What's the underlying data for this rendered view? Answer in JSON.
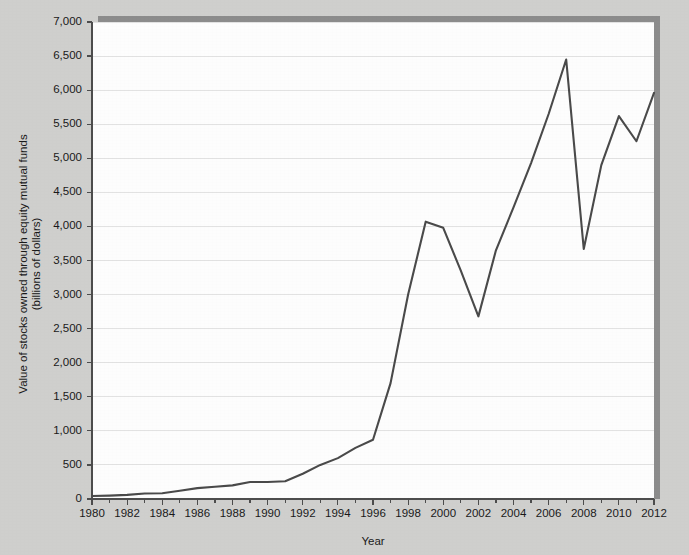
{
  "chart_data": {
    "type": "line",
    "title": "",
    "xlabel": "Year",
    "ylabel": "Value of stocks owned through equity mutual funds (billions of dollars)",
    "ylabel_line1": "Value of stocks owned through equity mutual funds",
    "ylabel_line2": "(billions of dollars)",
    "xlim": [
      1980,
      2012
    ],
    "ylim": [
      0,
      7000
    ],
    "grid": true,
    "legend": "none",
    "x_tick_labels": [
      "1980",
      "1982",
      "1984",
      "1986",
      "1988",
      "1990",
      "1992",
      "1994",
      "1996",
      "1998",
      "2000",
      "2002",
      "2004",
      "2006",
      "2008",
      "2010",
      "2012"
    ],
    "x_tick_values": [
      1980,
      1982,
      1984,
      1986,
      1988,
      1990,
      1992,
      1994,
      1996,
      1998,
      2000,
      2002,
      2004,
      2006,
      2008,
      2010,
      2012
    ],
    "x_minor_tick_values": [
      1981,
      1983,
      1985,
      1987,
      1989,
      1991,
      1993,
      1995,
      1997,
      1999,
      2001,
      2003,
      2005,
      2007,
      2009,
      2011
    ],
    "y_tick_labels": [
      "0",
      "500",
      "1,000",
      "1,500",
      "2,000",
      "2,500",
      "3,000",
      "3,500",
      "4,000",
      "4,500",
      "5,000",
      "5,500",
      "6,000",
      "6,500",
      "7,000"
    ],
    "y_tick_values": [
      0,
      500,
      1000,
      1500,
      2000,
      2500,
      3000,
      3500,
      4000,
      4500,
      5000,
      5500,
      6000,
      6500,
      7000
    ],
    "x": [
      1980,
      1981,
      1982,
      1983,
      1984,
      1985,
      1986,
      1987,
      1988,
      1989,
      1990,
      1991,
      1992,
      1993,
      1994,
      1995,
      1996,
      1997,
      1998,
      1999,
      2000,
      2001,
      2002,
      2003,
      2004,
      2005,
      2006,
      2007,
      2008,
      2009,
      2010,
      2011,
      2012
    ],
    "values": [
      45,
      50,
      60,
      80,
      85,
      120,
      160,
      180,
      200,
      250,
      250,
      260,
      370,
      500,
      600,
      750,
      870,
      1700,
      3000,
      4070,
      3980,
      3350,
      2680,
      3650,
      4280,
      4930,
      5650,
      6450,
      3670,
      4900,
      5620,
      5250,
      5960
    ],
    "series": [
      {
        "name": "Value of stocks owned through equity mutual funds",
        "color": "#4a4a4a",
        "values": [
          45,
          50,
          60,
          80,
          85,
          120,
          160,
          180,
          200,
          250,
          250,
          260,
          370,
          500,
          600,
          750,
          870,
          1700,
          3000,
          4070,
          3980,
          3350,
          2680,
          3650,
          4280,
          4930,
          5650,
          6450,
          3670,
          4900,
          5620,
          5250,
          5960
        ]
      }
    ],
    "colors": {
      "line": "#4a4a4a",
      "plot_background": "#fdfdfd",
      "figure_background": "#cfcfcd",
      "gridline": "#e2e2e2",
      "axis": "#4d4d4d",
      "shadow": "#8c8c8c"
    },
    "annotations": []
  }
}
